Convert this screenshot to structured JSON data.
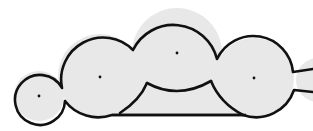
{
  "diagram": {
    "colors": {
      "fill": "#e8e8e8",
      "stroke": "#111111",
      "dot": "#111111",
      "background": "#ffffff"
    },
    "lobes": [
      {
        "id": "lobe-1",
        "cx": 39,
        "cy": 96,
        "r": 25
      },
      {
        "id": "lobe-2",
        "cx": 100,
        "cy": 76,
        "r": 42
      },
      {
        "id": "lobe-3",
        "cx": 177,
        "cy": 53,
        "r": 45
      },
      {
        "id": "lobe-4",
        "cx": 254,
        "cy": 78,
        "r": 40
      },
      {
        "id": "lobe-5",
        "cx": 318,
        "cy": 80,
        "r": 22
      }
    ],
    "center_dots": [
      {
        "id": "dot-1",
        "x": 39,
        "y": 96
      },
      {
        "id": "dot-2",
        "x": 100,
        "y": 77
      },
      {
        "id": "dot-3",
        "x": 177,
        "y": 53
      },
      {
        "id": "dot-4",
        "x": 254,
        "y": 78
      }
    ],
    "base_line": {
      "x1": 112,
      "y1": 115,
      "x2": 246,
      "y2": 115
    }
  }
}
